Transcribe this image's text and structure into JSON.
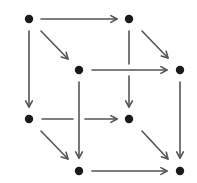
{
  "diagram": {
    "type": "commutative-cube",
    "colors": {
      "background": "#ffffff",
      "node": "#1a1a1a",
      "arrow": "#555555"
    },
    "nodes": [
      {
        "id": "A",
        "label": "",
        "x": 29,
        "y": 19
      },
      {
        "id": "B",
        "label": "",
        "x": 129,
        "y": 19
      },
      {
        "id": "C",
        "label": "",
        "x": 79,
        "y": 70
      },
      {
        "id": "D",
        "label": "",
        "x": 180,
        "y": 70
      },
      {
        "id": "E",
        "label": "",
        "x": 29,
        "y": 119
      },
      {
        "id": "F",
        "label": "",
        "x": 129,
        "y": 119
      },
      {
        "id": "G",
        "label": "",
        "x": 79,
        "y": 171
      },
      {
        "id": "H",
        "label": "",
        "x": 180,
        "y": 171
      }
    ],
    "edges": [
      {
        "from": "A",
        "to": "B",
        "x1": 41,
        "y1": 19,
        "x2": 117,
        "y2": 19
      },
      {
        "from": "A",
        "to": "C",
        "x1": 41,
        "y1": 31,
        "x2": 68,
        "y2": 59
      },
      {
        "from": "A",
        "to": "E",
        "x1": 29,
        "y1": 31,
        "x2": 29,
        "y2": 107
      },
      {
        "from": "B",
        "to": "D",
        "x1": 142,
        "y1": 31,
        "x2": 168,
        "y2": 58
      },
      {
        "from": "B",
        "to": "F",
        "x1": 129,
        "y1": 31,
        "x2": 129,
        "y2": 107,
        "gap": [
          64,
          76
        ]
      },
      {
        "from": "C",
        "to": "D",
        "x1": 92,
        "y1": 70,
        "x2": 167,
        "y2": 70
      },
      {
        "from": "C",
        "to": "G",
        "x1": 79,
        "y1": 82,
        "x2": 79,
        "y2": 158
      },
      {
        "from": "D",
        "to": "H",
        "x1": 180,
        "y1": 82,
        "x2": 180,
        "y2": 158
      },
      {
        "from": "E",
        "to": "F",
        "x1": 42,
        "y1": 119,
        "x2": 117,
        "y2": 119,
        "gap": [
          73,
          85
        ]
      },
      {
        "from": "E",
        "to": "G",
        "x1": 41,
        "y1": 131,
        "x2": 68,
        "y2": 159
      },
      {
        "from": "F",
        "to": "H",
        "x1": 142,
        "y1": 131,
        "x2": 168,
        "y2": 159
      },
      {
        "from": "G",
        "to": "H",
        "x1": 92,
        "y1": 171,
        "x2": 167,
        "y2": 171
      }
    ]
  }
}
